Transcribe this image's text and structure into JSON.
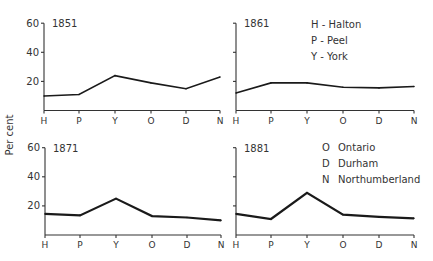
{
  "chart_data": {
    "type": "line",
    "ylabel": "Per cent",
    "categories": [
      "H",
      "P",
      "Y",
      "O",
      "D",
      "N"
    ],
    "ylim": [
      0,
      60
    ],
    "yticks": [
      20,
      40,
      60
    ],
    "grid": false,
    "panels": [
      {
        "title": "1851",
        "values": [
          10,
          11,
          24,
          19,
          15,
          23
        ],
        "y_tick_labels_shown": true
      },
      {
        "title": "1861",
        "values": [
          12,
          19,
          19,
          16,
          15.5,
          16.5
        ],
        "y_tick_labels_shown": false
      },
      {
        "title": "1871",
        "values": [
          14.5,
          13.5,
          25,
          13,
          12,
          10
        ],
        "y_tick_labels_shown": true
      },
      {
        "title": "1881",
        "values": [
          14.5,
          11,
          29,
          14,
          12.5,
          11.5
        ],
        "y_tick_labels_shown": false
      }
    ],
    "legend": [
      {
        "key": "H",
        "sep": "-",
        "label": "Halton"
      },
      {
        "key": "P",
        "sep": "-",
        "label": "Peel"
      },
      {
        "key": "Y",
        "sep": "-",
        "label": "York"
      },
      {
        "key": "O",
        "sep": "",
        "label": "Ontario"
      },
      {
        "key": "D",
        "sep": "",
        "label": "Durham"
      },
      {
        "key": "N",
        "sep": "",
        "label": "Northumberland"
      }
    ],
    "legend_placement": "top-right of upper-right and lower-right panels"
  }
}
